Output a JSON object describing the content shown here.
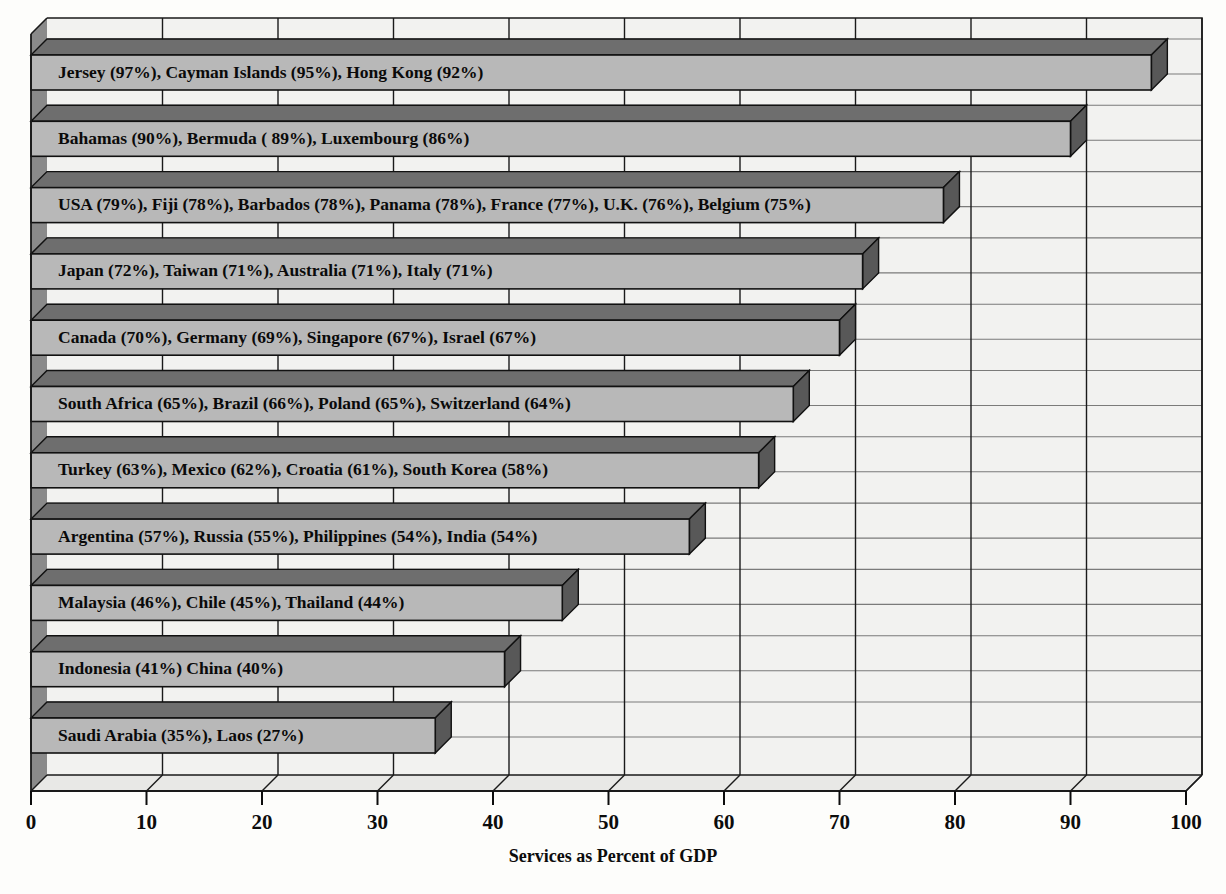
{
  "chart_data": {
    "type": "bar",
    "orientation": "horizontal",
    "title": "",
    "xlabel": "Services as Percent of GDP",
    "ylabel": "",
    "xlim": [
      0,
      100
    ],
    "xticks": [
      "0",
      "10",
      "20",
      "30",
      "40",
      "50",
      "60",
      "70",
      "80",
      "90",
      "100"
    ],
    "grid": true,
    "legend": false,
    "style": "3d-horizontal-bar",
    "categories": [
      "Jersey (97%), Cayman Islands (95%), Hong Kong (92%)",
      "Bahamas (90%), Bermuda ( 89%), Luxembourg (86%)",
      "USA (79%), Fiji (78%), Barbados (78%), Panama (78%), France (77%), U.K. (76%), Belgium (75%)",
      "Japan (72%), Taiwan (71%), Australia (71%), Italy (71%)",
      "Canada (70%), Germany (69%), Singapore (67%), Israel (67%)",
      "South Africa (65%), Brazil (66%), Poland (65%), Switzerland (64%)",
      "Turkey (63%), Mexico (62%), Croatia (61%), South Korea (58%)",
      "Argentina (57%), Russia (55%), Philippines (54%), India (54%)",
      "Malaysia (46%), Chile (45%), Thailand (44%)",
      "Indonesia (41%) China (40%)",
      "Saudi Arabia (35%), Laos (27%)"
    ],
    "values": [
      97,
      90,
      79,
      72,
      70,
      66,
      63,
      57,
      46,
      41,
      35
    ],
    "bars": [
      {
        "label": "Jersey (97%), Cayman Islands (95%), Hong Kong (92%)",
        "value": 97,
        "countries": [
          {
            "name": "Jersey",
            "percent": 97
          },
          {
            "name": "Cayman Islands",
            "percent": 95
          },
          {
            "name": "Hong Kong",
            "percent": 92
          }
        ]
      },
      {
        "label": "Bahamas (90%), Bermuda ( 89%), Luxembourg (86%)",
        "value": 90,
        "countries": [
          {
            "name": "Bahamas",
            "percent": 90
          },
          {
            "name": "Bermuda",
            "percent": 89
          },
          {
            "name": "Luxembourg",
            "percent": 86
          }
        ]
      },
      {
        "label": "USA (79%), Fiji (78%), Barbados (78%), Panama (78%), France (77%), U.K. (76%), Belgium (75%)",
        "value": 79,
        "countries": [
          {
            "name": "USA",
            "percent": 79
          },
          {
            "name": "Fiji",
            "percent": 78
          },
          {
            "name": "Barbados",
            "percent": 78
          },
          {
            "name": "Panama",
            "percent": 78
          },
          {
            "name": "France",
            "percent": 77
          },
          {
            "name": "U.K.",
            "percent": 76
          },
          {
            "name": "Belgium",
            "percent": 75
          }
        ]
      },
      {
        "label": "Japan (72%), Taiwan (71%), Australia (71%), Italy (71%)",
        "value": 72,
        "countries": [
          {
            "name": "Japan",
            "percent": 72
          },
          {
            "name": "Taiwan",
            "percent": 71
          },
          {
            "name": "Australia",
            "percent": 71
          },
          {
            "name": "Italy",
            "percent": 71
          }
        ]
      },
      {
        "label": "Canada (70%), Germany (69%), Singapore (67%), Israel (67%)",
        "value": 70,
        "countries": [
          {
            "name": "Canada",
            "percent": 70
          },
          {
            "name": "Germany",
            "percent": 69
          },
          {
            "name": "Singapore",
            "percent": 67
          },
          {
            "name": "Israel",
            "percent": 67
          }
        ]
      },
      {
        "label": "South Africa (65%), Brazil (66%), Poland (65%), Switzerland (64%)",
        "value": 66,
        "countries": [
          {
            "name": "South Africa",
            "percent": 65
          },
          {
            "name": "Brazil",
            "percent": 66
          },
          {
            "name": "Poland",
            "percent": 65
          },
          {
            "name": "Switzerland",
            "percent": 64
          }
        ]
      },
      {
        "label": "Turkey (63%), Mexico (62%), Croatia (61%), South Korea (58%)",
        "value": 63,
        "countries": [
          {
            "name": "Turkey",
            "percent": 63
          },
          {
            "name": "Mexico",
            "percent": 62
          },
          {
            "name": "Croatia",
            "percent": 61
          },
          {
            "name": "South Korea",
            "percent": 58
          }
        ]
      },
      {
        "label": "Argentina (57%), Russia (55%), Philippines (54%), India (54%)",
        "value": 57,
        "countries": [
          {
            "name": "Argentina",
            "percent": 57
          },
          {
            "name": "Russia",
            "percent": 55
          },
          {
            "name": "Philippines",
            "percent": 54
          },
          {
            "name": "India",
            "percent": 54
          }
        ]
      },
      {
        "label": "Malaysia (46%), Chile (45%), Thailand (44%)",
        "value": 46,
        "countries": [
          {
            "name": "Malaysia",
            "percent": 46
          },
          {
            "name": "Chile",
            "percent": 45
          },
          {
            "name": "Thailand",
            "percent": 44
          }
        ]
      },
      {
        "label": "Indonesia (41%) China (40%)",
        "value": 41,
        "countries": [
          {
            "name": "Indonesia",
            "percent": 41
          },
          {
            "name": "China",
            "percent": 40
          }
        ]
      },
      {
        "label": "Saudi Arabia (35%), Laos (27%)",
        "value": 35,
        "countries": [
          {
            "name": "Saudi Arabia",
            "percent": 35
          },
          {
            "name": "Laos",
            "percent": 27
          }
        ]
      }
    ],
    "colors": {
      "bar_face": "#b8b8b8",
      "bar_top": "#6e6e6e",
      "bar_side": "#585858",
      "bar_outline": "#111111",
      "plot_background": "#f2f2f0",
      "wall_left": "#8a8a8a",
      "floor": "#e8e8e6",
      "gridline": "#1a1a1a",
      "page_background": "#fdfdfb",
      "text": "#0a0a0a"
    }
  }
}
